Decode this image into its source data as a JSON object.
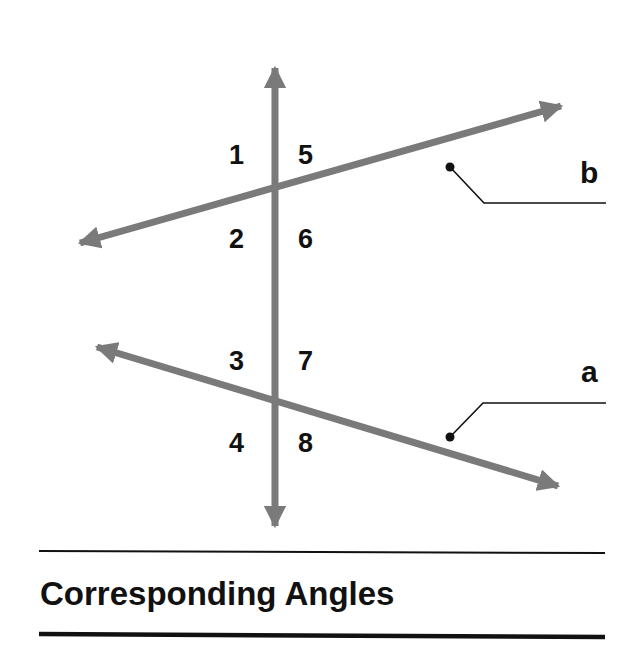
{
  "diagram": {
    "title": "Corresponding Angles",
    "lines": {
      "transversal": {
        "label": ""
      },
      "b": {
        "label": "b"
      },
      "a": {
        "label": "a"
      }
    },
    "angles": {
      "upper": [
        "1",
        "5",
        "2",
        "6"
      ],
      "lower": [
        "3",
        "7",
        "4",
        "8"
      ]
    },
    "colors": {
      "line": "#7a7a7a",
      "text": "#111111",
      "rule": "#111111"
    }
  }
}
